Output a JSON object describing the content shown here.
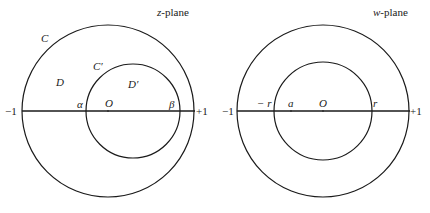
{
  "z_plane": {
    "title_var": "z",
    "title_rest": "-plane",
    "labels": {
      "outer_curve": "C",
      "inner_curve": "C′",
      "outer_region": "D",
      "inner_region": "D′",
      "left_point": "α",
      "origin": "O",
      "right_point": "β",
      "minus_one": "−1",
      "plus_one": "+1"
    }
  },
  "w_plane": {
    "title_var": "w",
    "title_rest": "-plane",
    "labels": {
      "minus_r": "− r",
      "a": "a",
      "origin": "O",
      "r": "r",
      "minus_one": "−1",
      "plus_one": "+1"
    }
  },
  "colors": {
    "stroke": "#1a1a1a",
    "background": "#ffffff"
  }
}
